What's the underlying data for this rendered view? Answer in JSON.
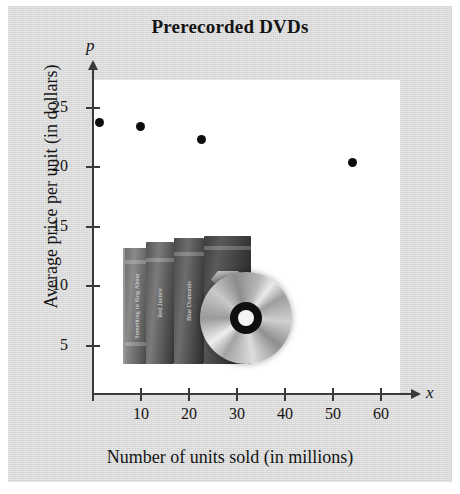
{
  "figure": {
    "background_color": "#d9d9d9",
    "plot_background_color": "#ffffff",
    "axis_color": "#3a3a3a",
    "point_color": "#0d0d0d"
  },
  "chart_data": {
    "type": "scatter",
    "title": "Prerecorded DVDs",
    "xlabel": "Number of units sold (in millions)",
    "ylabel": "Average price per unit (in dollars)",
    "x_variable": "x",
    "y_variable": "p",
    "xlim": [
      0,
      65
    ],
    "ylim": [
      0,
      27
    ],
    "xticks": [
      10,
      20,
      30,
      40,
      50,
      60
    ],
    "yticks": [
      5,
      10,
      15,
      20,
      25
    ],
    "xtick_labels": [
      "10",
      "20",
      "30",
      "40",
      "50",
      "60"
    ],
    "ytick_labels": [
      "5",
      "10",
      "15",
      "20",
      "25"
    ],
    "grid": false,
    "legend": false,
    "points": [
      {
        "x": 1.3,
        "y": 23.7
      },
      {
        "x": 9.8,
        "y": 23.4
      },
      {
        "x": 22.7,
        "y": 22.3
      },
      {
        "x": 54.0,
        "y": 20.4
      }
    ],
    "annotations": [
      {
        "name": "dvd-photo",
        "description": "Photograph of DVD cases with a disc"
      }
    ]
  },
  "inset_photo": {
    "cases": [
      {
        "title": "Something to Sing About"
      },
      {
        "title": "Red Justice"
      },
      {
        "title": "Blue Diamonds"
      },
      {
        "title": ""
      }
    ]
  }
}
